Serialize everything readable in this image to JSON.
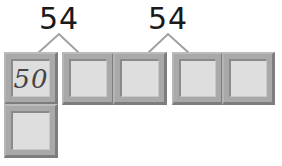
{
  "diagram": {
    "groups": [
      {
        "total_label": "54",
        "parts": [
          "50",
          ""
        ]
      },
      {
        "total_label": "54",
        "parts": [
          "",
          ""
        ]
      }
    ],
    "boxes": [
      {
        "id": 1,
        "value": "50",
        "style": "handwritten"
      },
      {
        "id": 2,
        "value": ""
      },
      {
        "id": 3,
        "value": ""
      },
      {
        "id": 4,
        "value": ""
      },
      {
        "id": 5,
        "value": ""
      },
      {
        "id": 6,
        "value": ""
      }
    ],
    "colors": {
      "box_frame": "#a9a9a9",
      "box_fill": "#dedede",
      "connector": "#a0a0a0",
      "label": "#1a1a1a"
    }
  }
}
